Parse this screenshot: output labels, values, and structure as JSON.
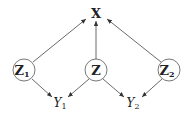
{
  "diagram": {
    "type": "causal-graph",
    "nodes": [
      {
        "id": "X",
        "label": "X",
        "subscript": "",
        "style": "bold",
        "circled": false
      },
      {
        "id": "Z1",
        "label": "Z",
        "subscript": "1",
        "style": "bold",
        "circled": true
      },
      {
        "id": "Z",
        "label": "Z",
        "subscript": "",
        "style": "bold",
        "circled": true
      },
      {
        "id": "Z2",
        "label": "Z",
        "subscript": "2",
        "style": "bold",
        "circled": true
      },
      {
        "id": "Y1",
        "label": "Y",
        "subscript": "1",
        "style": "italic",
        "circled": false
      },
      {
        "id": "Y2",
        "label": "Y",
        "subscript": "2",
        "style": "italic",
        "circled": false
      }
    ],
    "edges": [
      {
        "from": "Z1",
        "to": "X"
      },
      {
        "from": "Z",
        "to": "X"
      },
      {
        "from": "Z2",
        "to": "X"
      },
      {
        "from": "Z1",
        "to": "Y1"
      },
      {
        "from": "Z",
        "to": "Y1"
      },
      {
        "from": "Z",
        "to": "Y2"
      },
      {
        "from": "Z2",
        "to": "Y2"
      }
    ]
  }
}
